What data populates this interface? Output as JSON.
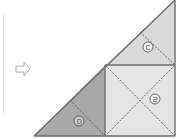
{
  "diagram": {
    "arrow": {
      "icon": "right-hollow-arrow-icon",
      "glyph": "⇨"
    },
    "labels": {
      "top_triangle": "ㄷ",
      "square": "ㄹ",
      "left_triangle": "ㅁ"
    },
    "colors": {
      "top_triangle_fill": "#d9d9d9",
      "square_fill": "#e4e4e4",
      "left_triangle_fill": "#a9a9a9",
      "outline": "#6e6e6e",
      "dashed": "#444444"
    }
  }
}
